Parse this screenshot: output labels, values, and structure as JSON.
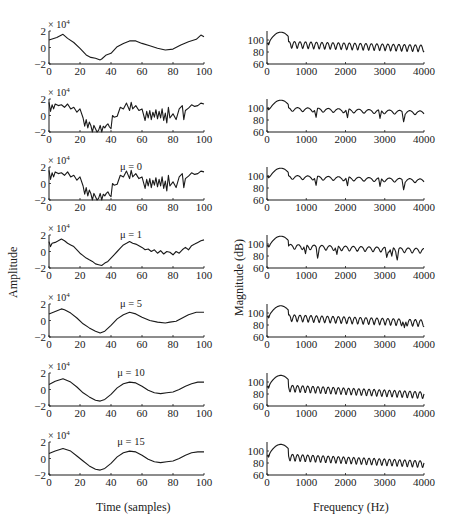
{
  "figure": {
    "left_ylabel": "Amplitude",
    "right_ylabel": "Magnitude (dB)",
    "left_xlabel": "Time (samples)",
    "right_xlabel": "Frequency (Hz)",
    "line_color": "#1a1a1a"
  },
  "chart_data": [
    {
      "type": "line",
      "column": "left",
      "row": 0,
      "annotation": "",
      "xlabel": "",
      "ylabel": "Amplitude",
      "multiplier": "× 10^4",
      "xlim": [
        0,
        100
      ],
      "ylim": [
        -2,
        2
      ],
      "xticks": [
        "0",
        "20",
        "40",
        "60",
        "80",
        "100"
      ],
      "yticks": [
        "−2",
        "0",
        "2"
      ],
      "x": [
        0,
        5,
        9,
        12,
        16,
        20,
        24,
        27,
        30,
        33,
        34,
        37,
        40,
        44,
        48,
        52,
        56,
        60,
        65,
        70,
        75,
        80,
        85,
        90,
        95,
        98,
        100
      ],
      "y": [
        0.9,
        1.2,
        1.6,
        1.1,
        0.6,
        -0.1,
        -0.9,
        -1.2,
        -1.3,
        -1.5,
        -1.4,
        -0.9,
        -0.7,
        0.1,
        0.5,
        0.8,
        0.8,
        0.5,
        0.2,
        -0.1,
        -0.3,
        -0.2,
        0.3,
        0.7,
        1.0,
        1.5,
        1.3
      ]
    },
    {
      "type": "line",
      "column": "left",
      "row": 1,
      "annotation": "",
      "xlabel": "",
      "ylabel": "Amplitude",
      "multiplier": "× 10^4",
      "xlim": [
        0,
        100
      ],
      "ylim": [
        -2,
        2
      ],
      "xticks": [
        "0",
        "20",
        "40",
        "60",
        "80",
        "100"
      ],
      "yticks": [
        "−2",
        "0",
        "2"
      ],
      "x": [
        0,
        1,
        2,
        3,
        4,
        6,
        8,
        10,
        12,
        14,
        16,
        18,
        20,
        22,
        23,
        24,
        25,
        26,
        27,
        28,
        29,
        30,
        31,
        32,
        33,
        34,
        35,
        36,
        37,
        38,
        39,
        40,
        41,
        42,
        44,
        46,
        48,
        50,
        52,
        53,
        54,
        56,
        58,
        60,
        62,
        63,
        64,
        65,
        66,
        67,
        68,
        69,
        70,
        71,
        72,
        73,
        74,
        75,
        76,
        77,
        78,
        80,
        82,
        84,
        86,
        87,
        88,
        90,
        92,
        94,
        96,
        98,
        100
      ],
      "y": [
        1.6,
        0.5,
        1.3,
        0.8,
        1.4,
        1.2,
        1.3,
        1.0,
        1.4,
        0.8,
        1.0,
        0.4,
        0.8,
        -0.3,
        -1.3,
        -0.5,
        -1.5,
        -0.8,
        -1.2,
        -2.0,
        -1.2,
        -1.6,
        -2.0,
        -1.8,
        -1.2,
        -2.0,
        -1.3,
        -1.5,
        -1.2,
        -1.0,
        -1.4,
        -1.6,
        0.0,
        -0.2,
        -0.1,
        1.0,
        0.8,
        1.5,
        0.6,
        1.6,
        0.8,
        1.2,
        0.6,
        0.8,
        -0.6,
        0.5,
        -0.3,
        0.6,
        -0.5,
        0.4,
        -0.2,
        0.7,
        -0.4,
        0.5,
        -0.3,
        0.8,
        -0.6,
        0.3,
        -0.9,
        1.0,
        -0.3,
        0.2,
        -0.5,
        0.8,
        1.2,
        -0.5,
        0.6,
        0.9,
        1.3,
        1.1,
        1.2,
        1.5,
        1.4
      ]
    },
    {
      "type": "line",
      "column": "left",
      "row": 2,
      "annotation": "μ = 0",
      "xlabel": "",
      "ylabel": "Amplitude",
      "multiplier": "× 10^4",
      "xlim": [
        0,
        100
      ],
      "ylim": [
        -2,
        2
      ],
      "xticks": [
        "0",
        "20",
        "40",
        "60",
        "80",
        "100"
      ],
      "yticks": [
        "−2",
        "0",
        "2"
      ],
      "x": [
        0,
        1,
        2,
        3,
        4,
        6,
        8,
        10,
        12,
        14,
        16,
        18,
        20,
        22,
        23,
        24,
        25,
        26,
        27,
        28,
        29,
        30,
        31,
        32,
        33,
        34,
        35,
        36,
        37,
        38,
        39,
        40,
        41,
        42,
        44,
        46,
        48,
        50,
        52,
        53,
        54,
        56,
        58,
        60,
        62,
        63,
        64,
        65,
        66,
        67,
        68,
        69,
        70,
        71,
        72,
        73,
        74,
        75,
        76,
        77,
        78,
        80,
        82,
        84,
        86,
        87,
        88,
        90,
        92,
        94,
        96,
        98,
        100
      ],
      "y": [
        1.6,
        0.5,
        1.3,
        0.8,
        1.4,
        1.2,
        1.3,
        1.0,
        1.4,
        0.8,
        1.0,
        0.4,
        0.8,
        -0.3,
        -1.3,
        -0.5,
        -1.5,
        -0.8,
        -1.2,
        -2.0,
        -1.2,
        -1.6,
        -2.0,
        -1.8,
        -1.2,
        -2.0,
        -1.3,
        -1.5,
        -1.2,
        -1.0,
        -1.4,
        -1.6,
        0.0,
        -0.2,
        -0.1,
        1.0,
        0.8,
        1.5,
        0.6,
        1.6,
        0.8,
        1.2,
        0.6,
        0.8,
        -0.6,
        0.5,
        -0.3,
        0.6,
        -0.5,
        0.4,
        -0.2,
        0.7,
        -0.4,
        0.5,
        -0.3,
        0.8,
        -0.6,
        0.3,
        -0.9,
        1.0,
        -0.3,
        0.2,
        -0.5,
        0.8,
        1.2,
        -0.5,
        0.6,
        0.9,
        1.3,
        1.1,
        1.2,
        1.5,
        1.4
      ]
    },
    {
      "type": "line",
      "column": "left",
      "row": 3,
      "annotation": "μ = 1",
      "xlabel": "",
      "ylabel": "Amplitude",
      "multiplier": "× 10^4",
      "xlim": [
        0,
        100
      ],
      "ylim": [
        -2,
        2
      ],
      "xticks": [
        "0",
        "20",
        "40",
        "60",
        "80",
        "100"
      ],
      "yticks": [
        "−2",
        "0",
        "2"
      ],
      "x": [
        0,
        1,
        2,
        4,
        6,
        8,
        10,
        12,
        14,
        16,
        18,
        20,
        22,
        24,
        26,
        28,
        30,
        32,
        34,
        36,
        38,
        40,
        42,
        44,
        46,
        48,
        50,
        52,
        54,
        56,
        58,
        60,
        62,
        64,
        66,
        68,
        70,
        72,
        74,
        76,
        78,
        80,
        82,
        84,
        86,
        88,
        90,
        92,
        94,
        96,
        98,
        100
      ],
      "y": [
        1.2,
        0.6,
        1.0,
        1.1,
        1.3,
        1.5,
        1.3,
        1.0,
        0.8,
        0.6,
        0.2,
        -0.2,
        -0.5,
        -0.8,
        -1.0,
        -1.2,
        -1.5,
        -1.6,
        -1.7,
        -1.4,
        -1.2,
        -0.8,
        -0.4,
        0.0,
        0.4,
        0.8,
        1.0,
        1.2,
        1.0,
        0.9,
        0.7,
        0.5,
        0.2,
        0.3,
        0.0,
        0.2,
        -0.2,
        0.1,
        -0.3,
        0.0,
        -0.1,
        -0.4,
        0.0,
        -0.2,
        0.2,
        0.5,
        0.2,
        0.7,
        0.9,
        1.1,
        1.3,
        1.4
      ]
    },
    {
      "type": "line",
      "column": "left",
      "row": 4,
      "annotation": "μ = 5",
      "xlabel": "",
      "ylabel": "Amplitude",
      "multiplier": "× 10^4",
      "xlim": [
        0,
        100
      ],
      "ylim": [
        -2,
        2
      ],
      "xticks": [
        "0",
        "20",
        "40",
        "60",
        "80",
        "100"
      ],
      "yticks": [
        "−2",
        "0",
        "2"
      ],
      "x": [
        0,
        4,
        8,
        10,
        14,
        18,
        22,
        26,
        30,
        33,
        36,
        40,
        44,
        48,
        52,
        56,
        60,
        65,
        70,
        75,
        78,
        82,
        86,
        90,
        95,
        100
      ],
      "y": [
        0.8,
        1.1,
        1.4,
        1.3,
        0.9,
        0.3,
        -0.4,
        -0.9,
        -1.3,
        -1.5,
        -1.3,
        -0.6,
        0.2,
        0.7,
        1.0,
        0.8,
        0.4,
        0.0,
        -0.2,
        -0.3,
        -0.2,
        -0.1,
        0.3,
        0.7,
        1.0,
        1.0
      ]
    },
    {
      "type": "line",
      "column": "left",
      "row": 5,
      "annotation": "μ = 10",
      "xlabel": "",
      "ylabel": "Amplitude",
      "multiplier": "× 10^4",
      "xlim": [
        0,
        100
      ],
      "ylim": [
        -2,
        2
      ],
      "xticks": [
        "0",
        "20",
        "40",
        "60",
        "80",
        "100"
      ],
      "yticks": [
        "−2",
        "0",
        "2"
      ],
      "x": [
        0,
        4,
        9,
        14,
        18,
        22,
        26,
        30,
        33,
        36,
        40,
        44,
        48,
        52,
        56,
        60,
        64,
        68,
        72,
        76,
        80,
        84,
        88,
        92,
        96,
        100
      ],
      "y": [
        0.6,
        1.0,
        1.3,
        0.9,
        0.3,
        -0.4,
        -0.9,
        -1.3,
        -1.4,
        -1.2,
        -0.6,
        0.2,
        0.7,
        0.9,
        0.8,
        0.4,
        -0.1,
        -0.4,
        -0.5,
        -0.4,
        -0.3,
        0.0,
        0.4,
        0.7,
        0.9,
        0.9
      ]
    },
    {
      "type": "line",
      "column": "left",
      "row": 6,
      "annotation": "μ = 15",
      "xlabel": "Time (samples)",
      "ylabel": "Amplitude",
      "multiplier": "× 10^4",
      "xlim": [
        0,
        100
      ],
      "ylim": [
        -2,
        2
      ],
      "xticks": [
        "0",
        "20",
        "40",
        "60",
        "80",
        "100"
      ],
      "yticks": [
        "−2",
        "0",
        "2"
      ],
      "x": [
        0,
        4,
        9,
        14,
        18,
        22,
        26,
        30,
        33,
        36,
        40,
        44,
        48,
        52,
        56,
        60,
        64,
        68,
        72,
        76,
        80,
        84,
        88,
        92,
        96,
        100
      ],
      "y": [
        0.6,
        0.9,
        1.2,
        0.9,
        0.3,
        -0.3,
        -0.9,
        -1.3,
        -1.4,
        -1.2,
        -0.6,
        0.2,
        0.7,
        0.9,
        0.8,
        0.4,
        -0.1,
        -0.4,
        -0.5,
        -0.4,
        -0.3,
        0.0,
        0.4,
        0.7,
        0.8,
        0.8
      ]
    },
    {
      "type": "line",
      "column": "right",
      "row": 0,
      "annotation": "",
      "xlabel": "",
      "ylabel": "Magnitude (dB)",
      "xlim": [
        0,
        4000
      ],
      "ylim": [
        60,
        115
      ],
      "xticks": [
        "0",
        "1000",
        "2000",
        "3000",
        "4000"
      ],
      "yticks": [
        "60",
        "80",
        "100"
      ],
      "pattern": {
        "base_start": 95,
        "base_end": 88,
        "ripple": 7,
        "period": 140,
        "peak_hz": 350,
        "peak_db": 113,
        "dips": []
      }
    },
    {
      "type": "line",
      "column": "right",
      "row": 1,
      "annotation": "",
      "xlabel": "",
      "ylabel": "Magnitude (dB)",
      "xlim": [
        0,
        4000
      ],
      "ylim": [
        60,
        115
      ],
      "xticks": [
        "0",
        "1000",
        "2000",
        "3000",
        "4000"
      ],
      "yticks": [
        "60",
        "80",
        "100"
      ],
      "pattern": {
        "base_start": 100,
        "base_end": 93,
        "ripple": 4,
        "period": 260,
        "peak_hz": 350,
        "peak_db": 113,
        "dips": [
          1250,
          2050,
          2880,
          3480
        ]
      }
    },
    {
      "type": "line",
      "column": "right",
      "row": 2,
      "annotation": "",
      "xlabel": "",
      "ylabel": "Magnitude (dB)",
      "xlim": [
        0,
        4000
      ],
      "ylim": [
        60,
        115
      ],
      "xticks": [
        "0",
        "1000",
        "2000",
        "3000",
        "4000"
      ],
      "yticks": [
        "60",
        "80",
        "100"
      ],
      "pattern": {
        "base_start": 100,
        "base_end": 93,
        "ripple": 4,
        "period": 260,
        "peak_hz": 350,
        "peak_db": 113,
        "dips": [
          1250,
          2050,
          2880,
          3480
        ]
      }
    },
    {
      "type": "line",
      "column": "right",
      "row": 3,
      "annotation": "",
      "xlabel": "",
      "ylabel": "Magnitude (dB)",
      "xlim": [
        0,
        4000
      ],
      "ylim": [
        60,
        115
      ],
      "xticks": [
        "0",
        "1000",
        "2000",
        "3000",
        "4000"
      ],
      "yticks": [
        "60",
        "80",
        "100"
      ],
      "pattern": {
        "base_start": 98,
        "base_end": 90,
        "ripple": 5,
        "period": 200,
        "peak_hz": 350,
        "peak_db": 113,
        "dips": [
          980,
          1290,
          1780,
          3050,
          3180,
          3320
        ]
      }
    },
    {
      "type": "line",
      "column": "right",
      "row": 4,
      "annotation": "",
      "xlabel": "",
      "ylabel": "Magnitude (dB)",
      "xlim": [
        0,
        4000
      ],
      "ylim": [
        60,
        115
      ],
      "xticks": [
        "0",
        "1000",
        "2000",
        "3000",
        "4000"
      ],
      "yticks": [
        "60",
        "80",
        "100"
      ],
      "pattern": {
        "base_start": 95,
        "base_end": 85,
        "ripple": 7,
        "period": 140,
        "peak_hz": 350,
        "peak_db": 112,
        "dips": [
          3500
        ]
      }
    },
    {
      "type": "line",
      "column": "right",
      "row": 5,
      "annotation": "",
      "xlabel": "",
      "ylabel": "Magnitude (dB)",
      "xlim": [
        0,
        4000
      ],
      "ylim": [
        60,
        115
      ],
      "xticks": [
        "0",
        "1000",
        "2000",
        "3000",
        "4000"
      ],
      "yticks": [
        "60",
        "80",
        "100"
      ],
      "pattern": {
        "base_start": 93,
        "base_end": 80,
        "ripple": 7,
        "period": 130,
        "peak_hz": 350,
        "peak_db": 111,
        "dips": []
      }
    },
    {
      "type": "line",
      "column": "right",
      "row": 6,
      "annotation": "",
      "xlabel": "Frequency (Hz)",
      "ylabel": "Magnitude (dB)",
      "xlim": [
        0,
        4000
      ],
      "ylim": [
        60,
        115
      ],
      "xticks": [
        "0",
        "1000",
        "2000",
        "3000",
        "4000"
      ],
      "yticks": [
        "60",
        "80",
        "100"
      ],
      "pattern": {
        "base_start": 93,
        "base_end": 80,
        "ripple": 7,
        "period": 130,
        "peak_hz": 350,
        "peak_db": 111,
        "dips": []
      }
    }
  ]
}
